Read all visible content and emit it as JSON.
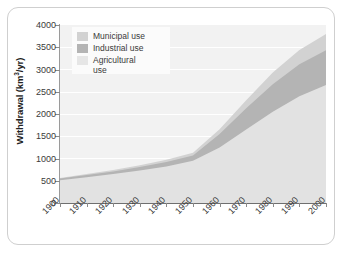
{
  "chart_data": {
    "type": "area",
    "title": "",
    "subtitle": "",
    "xlabel": "",
    "ylabel": "Withdrawal (km3/yr)",
    "ylabel_parts": {
      "prefix": "Withdrawal (km",
      "sup": "3",
      "suffix": "/yr)"
    },
    "x": [
      1900,
      1910,
      1920,
      1930,
      1940,
      1950,
      1960,
      1970,
      1980,
      1990,
      2000
    ],
    "categories": [
      "1900",
      "1910",
      "1920",
      "1930",
      "1940",
      "1950",
      "1960",
      "1970",
      "1980",
      "1990",
      "2000"
    ],
    "xlim": [
      1900,
      2000
    ],
    "ylim": [
      0,
      4000
    ],
    "ytick_values": [
      0,
      500,
      1000,
      1500,
      2000,
      2500,
      3000,
      3500,
      4000
    ],
    "ytick_labels": [
      "0",
      "500",
      "1000",
      "1500",
      "2000",
      "2500",
      "3000",
      "3500",
      "4000"
    ],
    "grid": true,
    "grid_color": "#ffffff",
    "plot_background": "#f2f2f2",
    "stacked": true,
    "stack_order_bottom_to_top": [
      "Agricultural use",
      "Industrial use",
      "Municipal use"
    ],
    "legend_position": "top-left",
    "series": [
      {
        "name": "Agricultural use",
        "color": "#e2e2e2",
        "values": [
          510,
          580,
          650,
          730,
          820,
          950,
          1250,
          1650,
          2050,
          2400,
          2650
        ]
      },
      {
        "name": "Industrial use",
        "color": "#b4b4b4",
        "values": [
          40,
          50,
          60,
          80,
          100,
          120,
          300,
          480,
          620,
          720,
          780
        ]
      },
      {
        "name": "Municipal use",
        "color": "#d2d2d2",
        "values": [
          10,
          20,
          30,
          40,
          50,
          60,
          110,
          180,
          260,
          320,
          370
        ]
      }
    ],
    "cumulative_totals": [
      560,
      650,
      740,
      850,
      970,
      1130,
      1660,
      2310,
      2930,
      3440,
      3800
    ]
  },
  "legend": {
    "entries": [
      {
        "label": "Municipal use",
        "color": "#d2d2d2",
        "swatch": "municipal-swatch"
      },
      {
        "label": "Industrial use",
        "color": "#b4b4b4",
        "swatch": "industrial-swatch"
      },
      {
        "label": "Agricultural\nuse",
        "color": "#e6e6e6",
        "swatch": "agricultural-swatch"
      }
    ]
  },
  "colors": {
    "municipal": "#d2d2d2",
    "industrial": "#b4b4b4",
    "agricultural": "#e2e2e2",
    "plot_bg": "#f2f2f2",
    "gridline": "#ffffff",
    "axis": "#8a8a8a",
    "text": "#3a3a3a",
    "frame_border": "#cfcfcf"
  }
}
